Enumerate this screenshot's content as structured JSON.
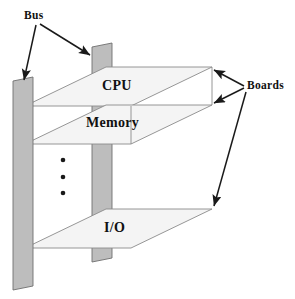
{
  "figure": {
    "background_color": "#ffffff",
    "width": 295,
    "height": 299
  },
  "colors": {
    "bus_fill": "#bdbdbd",
    "bus_stroke": "#6f6f6f",
    "board_fill": "#f4f4f4",
    "board_stroke": "#8a8a8a",
    "line": "#1a1a1a",
    "text": "#111111"
  },
  "annotations": {
    "bus_label": "Bus",
    "boards_label": "Boards"
  },
  "boards": [
    {
      "id": "cpu",
      "label": "CPU"
    },
    {
      "id": "memory",
      "label": "Memory"
    },
    {
      "id": "io",
      "label": "I/O"
    }
  ],
  "ellipsis": {
    "name": "vertical-ellipsis",
    "dot_count": 3,
    "glyph": "•"
  },
  "bus_bars": [
    {
      "id": "bus-front",
      "name": "front-bus-bar"
    },
    {
      "id": "bus-back",
      "name": "back-bus-bar"
    }
  ],
  "leaders": {
    "bus_arrow_count": 2,
    "boards_arrow_count": 3
  }
}
